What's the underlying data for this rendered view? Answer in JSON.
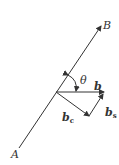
{
  "diagram": {
    "type": "vector decomposition",
    "line": {
      "start_label": "A",
      "end_label": "B"
    },
    "angle_label": "θ",
    "vectors": {
      "b": {
        "label": "b"
      },
      "b_c": {
        "label": "b",
        "subscript": "c"
      },
      "b_s": {
        "label": "b",
        "subscript": "s"
      }
    },
    "stroke_color": "#333333"
  }
}
